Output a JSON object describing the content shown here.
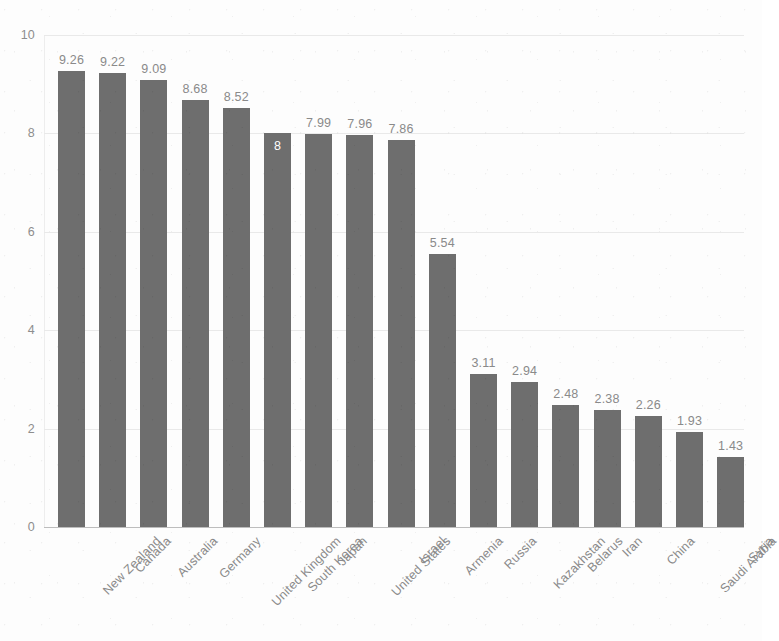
{
  "chart_data": {
    "type": "bar",
    "title": "",
    "subtitle": "",
    "xlabel": "",
    "ylabel": "",
    "ylim": [
      0,
      10
    ],
    "yticks": [
      "0",
      "2",
      "4",
      "6",
      "8",
      "10"
    ],
    "ytick_values": [
      0,
      2,
      4,
      6,
      8,
      10
    ],
    "grid": true,
    "legend": "none",
    "orientation": "vertical",
    "bar_color": "#6e6e6e",
    "label_color": "#8a8a8a",
    "inside_label_color": "#ffffff",
    "gridline_color": "#e9e9e9",
    "background_color": "#fdfdfd",
    "categories": [
      "New Zealand",
      "Canada",
      "Australia",
      "Germany",
      "United Kingdom",
      "South Korea",
      "Japan",
      "United States",
      "Israel",
      "Armenia",
      "Russia",
      "Kazakhstan",
      "Belarus",
      "Iran",
      "China",
      "Saudi Arabia",
      "Syria"
    ],
    "values": [
      9.26,
      9.22,
      9.09,
      8.68,
      8.52,
      8,
      7.99,
      7.96,
      7.86,
      5.54,
      3.11,
      2.94,
      2.48,
      2.38,
      2.26,
      1.93,
      1.43
    ],
    "data_labels": [
      "9.26",
      "9.22",
      "9.09",
      "8.68",
      "8.52",
      "8",
      "7.99",
      "7.96",
      "7.86",
      "5.54",
      "3.11",
      "2.94",
      "2.48",
      "2.38",
      "2.26",
      "1.93",
      "1.43"
    ],
    "label_placement": [
      "outside",
      "outside",
      "outside",
      "outside",
      "outside",
      "inside",
      "outside",
      "outside",
      "outside",
      "outside",
      "outside",
      "outside",
      "outside",
      "outside",
      "outside",
      "outside",
      "outside"
    ]
  }
}
